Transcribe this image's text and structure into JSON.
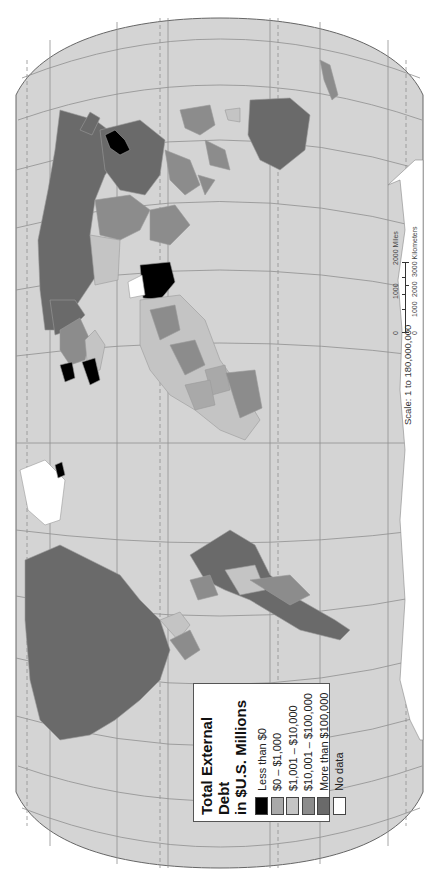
{
  "map": {
    "title": "Total External Debt in $U.S. Millions",
    "orientation": "rotated 90 degrees clockwise (north at left)",
    "colors": {
      "ocean": "#d4d4d4",
      "graticule": "#8a8a8a",
      "border": "#9a9a9a",
      "less_than_0": "#000000",
      "0_to_1000": "#a9a9a9",
      "1001_to_10000": "#c4c4c4",
      "10001_to_100000": "#8c8c8c",
      "more_than_100000": "#6a6a6a",
      "no_data": "#ffffff"
    }
  },
  "legend": {
    "title_line1": "Total External Debt",
    "title_line2": "in $U.S. Millions",
    "items": [
      {
        "label": "Less than $0",
        "color": "#000000"
      },
      {
        "label": "$0 – $1,000",
        "color": "#a9a9a9"
      },
      {
        "label": "$1,001 – $10,000",
        "color": "#c4c4c4"
      },
      {
        "label": "$10,001 – $100,000",
        "color": "#8c8c8c"
      },
      {
        "label": "More than $100,000",
        "color": "#6a6a6a"
      },
      {
        "label": "No data",
        "color": "#ffffff"
      }
    ]
  },
  "scale": {
    "label": "Scale:  1 to 180,000,000",
    "miles_ticks": [
      "0",
      "1000",
      "2000 Miles"
    ],
    "km_ticks": [
      "0",
      "1000",
      "2000",
      "3000 Kilometers"
    ]
  }
}
